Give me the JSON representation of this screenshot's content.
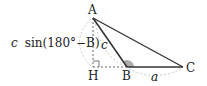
{
  "diagram": {
    "points": {
      "A": {
        "label": "A",
        "x": 93,
        "y": 18
      },
      "H": {
        "label": "H",
        "x": 93,
        "y": 67
      },
      "B": {
        "label": "B",
        "x": 127,
        "y": 67
      },
      "C": {
        "label": "C",
        "x": 183,
        "y": 67
      }
    },
    "side_labels": {
      "c": "c",
      "a": "a"
    },
    "height_label": {
      "prefix": "c",
      "expression": "sin(180°−B)"
    },
    "colors": {
      "line": "#333333",
      "dashed": "#555555",
      "arc": "#bbbbbb",
      "angle_fill": "#999999"
    }
  }
}
